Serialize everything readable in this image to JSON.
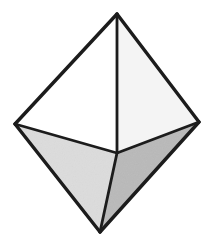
{
  "figure": {
    "background_color": "#ffffff",
    "canvas": {
      "width": 210,
      "height": 245
    }
  },
  "style": {
    "edge_color": "#1c1c1c",
    "edge_width_outer": 3.4,
    "edge_width_inner": 2.8,
    "face_white": "#ffffff",
    "face_offwhite": "#f4f4f4",
    "face_light_gray": "#dcdcdc",
    "face_mid_gray": "#b9b9b9",
    "speckle_opacity": 0.08
  },
  "vertices": [
    {
      "name": "top-apex",
      "label": "A",
      "x": 117,
      "y": 14
    },
    {
      "name": "left-vertex",
      "label": "B",
      "x": 15,
      "y": 124
    },
    {
      "name": "right-vertex",
      "label": "C",
      "x": 199,
      "y": 122
    },
    {
      "name": "front-vertex",
      "label": "D",
      "x": 117,
      "y": 153
    },
    {
      "name": "bottom-apex",
      "label": "E",
      "x": 100,
      "y": 232
    }
  ],
  "faces": [
    {
      "name": "upper-left-face",
      "points": "117,14 15,124 117,153",
      "fill": "#ffffff",
      "shade": "white"
    },
    {
      "name": "upper-right-face",
      "points": "117,14 199,122 117,153",
      "fill": "#f4f4f4",
      "shade": "off-white"
    },
    {
      "name": "lower-left-face",
      "points": "15,124 117,153 100,232",
      "fill": "#dcdcdc",
      "shade": "light-gray"
    },
    {
      "name": "lower-right-face",
      "points": "199,122 117,153 100,232",
      "fill": "#b9b9b9",
      "shade": "mid-gray"
    }
  ],
  "edges": [
    {
      "name": "edge-apex-to-left",
      "from": "top-apex",
      "to": "left-vertex",
      "x1": 117,
      "y1": 14,
      "x2": 15,
      "y2": 124,
      "kind": "outer"
    },
    {
      "name": "edge-apex-to-right",
      "from": "top-apex",
      "to": "right-vertex",
      "x1": 117,
      "y1": 14,
      "x2": 199,
      "y2": 122,
      "kind": "outer"
    },
    {
      "name": "edge-left-to-bottom",
      "from": "left-vertex",
      "to": "bottom-apex",
      "x1": 15,
      "y1": 124,
      "x2": 100,
      "y2": 232,
      "kind": "outer"
    },
    {
      "name": "edge-right-to-bottom",
      "from": "right-vertex",
      "to": "bottom-apex",
      "x1": 199,
      "y1": 122,
      "x2": 100,
      "y2": 232,
      "kind": "outer"
    },
    {
      "name": "edge-apex-to-front",
      "from": "top-apex",
      "to": "front-vertex",
      "x1": 117,
      "y1": 14,
      "x2": 117,
      "y2": 153,
      "kind": "inner"
    },
    {
      "name": "edge-left-to-front",
      "from": "left-vertex",
      "to": "front-vertex",
      "x1": 15,
      "y1": 124,
      "x2": 117,
      "y2": 153,
      "kind": "inner"
    },
    {
      "name": "edge-right-to-front",
      "from": "right-vertex",
      "to": "front-vertex",
      "x1": 199,
      "y1": 122,
      "x2": 117,
      "y2": 153,
      "kind": "inner"
    },
    {
      "name": "edge-front-to-bottom",
      "from": "front-vertex",
      "to": "bottom-apex",
      "x1": 117,
      "y1": 153,
      "x2": 100,
      "y2": 232,
      "kind": "inner"
    }
  ],
  "labels": {
    "visible": false,
    "items": []
  }
}
